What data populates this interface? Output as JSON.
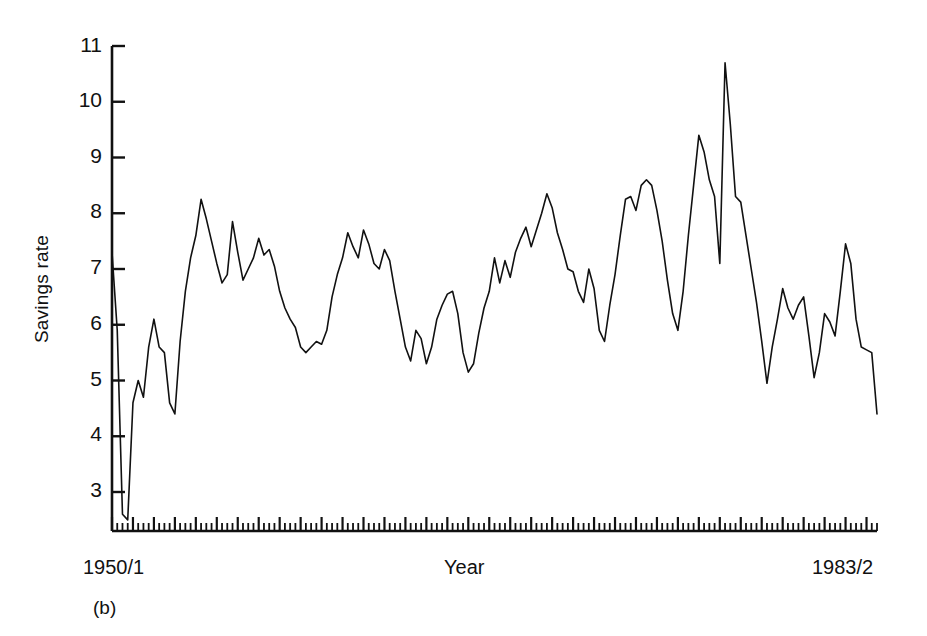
{
  "figure": {
    "panel_label": "(b)",
    "axes": {
      "y_title": "Savings rate",
      "x_title": "Year",
      "x_start_label": "1950/1",
      "x_end_label": "1983/2",
      "y_ticks": [
        11,
        10,
        9,
        8,
        7,
        6,
        5,
        4,
        3
      ],
      "y_tick_labels": [
        "11",
        "10",
        "9",
        "8",
        "7",
        "6",
        "5",
        "4",
        "3"
      ],
      "line_color": "#111111"
    }
  },
  "chart_data": {
    "type": "line",
    "title": "",
    "subtitle": "",
    "xlabel": "Year",
    "ylabel": "Savings rate",
    "xlim": [
      "1950/1",
      "1983/2"
    ],
    "ylim": [
      2.4,
      11.0
    ],
    "yticks": [
      3,
      4,
      5,
      6,
      7,
      8,
      9,
      10,
      11
    ],
    "grid": false,
    "legend": null,
    "x_start_label": "1950/1",
    "x_end_label": "1983/2",
    "x_tick_interval": "quarterly (minor), yearly (major)",
    "n_points": 134,
    "series": [
      {
        "name": "Savings rate",
        "color": "#111111",
        "values": [
          7.3,
          5.9,
          2.6,
          2.5,
          4.6,
          5.0,
          4.7,
          5.6,
          6.1,
          5.6,
          5.5,
          4.6,
          4.4,
          5.7,
          6.6,
          7.2,
          7.6,
          8.25,
          7.9,
          7.5,
          7.1,
          6.75,
          6.9,
          7.85,
          7.3,
          6.8,
          7.0,
          7.2,
          7.55,
          7.25,
          7.35,
          7.05,
          6.6,
          6.3,
          6.1,
          5.95,
          5.6,
          5.5,
          5.6,
          5.7,
          5.65,
          5.9,
          6.5,
          6.9,
          7.2,
          7.65,
          7.4,
          7.2,
          7.7,
          7.45,
          7.1,
          7.0,
          7.35,
          7.15,
          6.6,
          6.1,
          5.6,
          5.35,
          5.9,
          5.75,
          5.3,
          5.6,
          6.1,
          6.35,
          6.55,
          6.6,
          6.2,
          5.5,
          5.15,
          5.3,
          5.85,
          6.3,
          6.6,
          7.2,
          6.75,
          7.15,
          6.85,
          7.3,
          7.55,
          7.75,
          7.4,
          7.7,
          8.0,
          8.35,
          8.1,
          7.65,
          7.35,
          7.0,
          6.95,
          6.6,
          6.4,
          7.0,
          6.65,
          5.9,
          5.7,
          6.35,
          6.9,
          7.6,
          8.25,
          8.3,
          8.05,
          8.5,
          8.6,
          8.5,
          8.05,
          7.5,
          6.8,
          6.2,
          5.9,
          6.6,
          7.6,
          8.5,
          9.4,
          9.1,
          8.6,
          8.3,
          7.1,
          10.7,
          9.6,
          8.3,
          8.2,
          7.6,
          7.0,
          6.4,
          5.7,
          4.95,
          5.6,
          6.1,
          6.65,
          6.3,
          6.1,
          6.35,
          6.5,
          5.8,
          5.05,
          5.5,
          6.2,
          6.05,
          5.8,
          6.6,
          7.45,
          7.1,
          6.1,
          5.6,
          5.55,
          5.5,
          4.4
        ]
      }
    ]
  }
}
